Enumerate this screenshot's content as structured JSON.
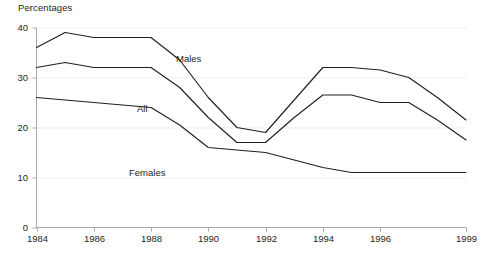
{
  "chart_data": {
    "type": "line",
    "title": "Percentages",
    "xlabel": "",
    "ylabel": "",
    "x": [
      1984,
      1985,
      1986,
      1987,
      1988,
      1989,
      1990,
      1991,
      1992,
      1993,
      1994,
      1995,
      1996,
      1997,
      1998,
      1999
    ],
    "xlim": [
      1984,
      1999
    ],
    "ylim": [
      0,
      40
    ],
    "ytick_values": [
      0,
      10,
      20,
      30,
      40
    ],
    "ytick_labels": [
      "0",
      "10",
      "20",
      "30",
      "40"
    ],
    "xtick_values": [
      1984,
      1986,
      1988,
      1990,
      1992,
      1994,
      1996,
      1999
    ],
    "xtick_labels": [
      "1984",
      "1986",
      "1988",
      "1990",
      "1992",
      "1994",
      "1996",
      "1999"
    ],
    "grid": true,
    "legend": "inline-labels",
    "series": [
      {
        "name": "Males",
        "label": "Males",
        "color": "#231f20",
        "values": [
          36.0,
          39.0,
          38.0,
          38.0,
          38.0,
          33.5,
          26.0,
          20.0,
          19.0,
          25.5,
          32.0,
          32.0,
          31.5,
          30.0,
          26.0,
          21.5
        ]
      },
      {
        "name": "All",
        "label": "All",
        "color": "#231f20",
        "values": [
          32.0,
          33.0,
          32.0,
          32.0,
          32.0,
          28.0,
          22.0,
          17.0,
          17.0,
          22.0,
          26.5,
          26.5,
          25.0,
          25.0,
          21.5,
          17.5
        ]
      },
      {
        "name": "Females",
        "label": "Females",
        "color": "#231f20",
        "values": [
          26.0,
          25.5,
          25.0,
          24.5,
          24.0,
          20.5,
          16.0,
          15.5,
          15.0,
          13.5,
          12.0,
          11.0,
          11.0,
          11.0,
          11.0,
          11.0
        ]
      }
    ],
    "annotations": [
      {
        "text": "Males",
        "x_px": 176,
        "y_px": 53
      },
      {
        "text": "All",
        "x_px": 137,
        "y_px": 103
      },
      {
        "text": "Females",
        "x_px": 129,
        "y_px": 167
      }
    ]
  }
}
